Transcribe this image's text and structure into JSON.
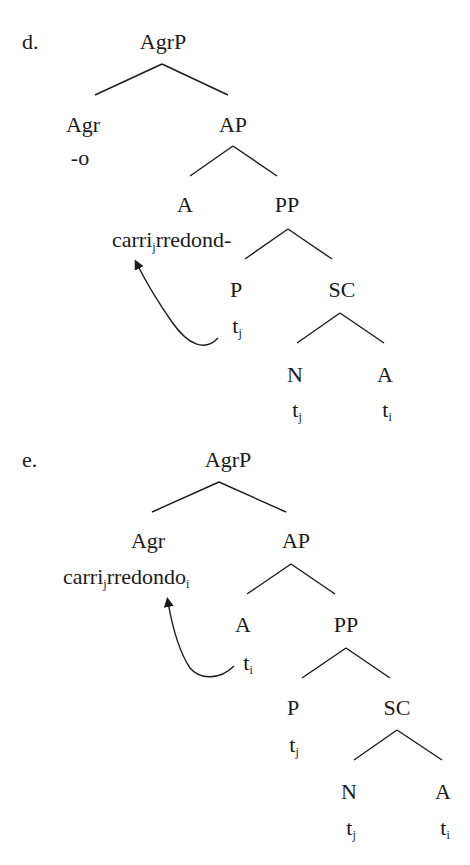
{
  "diagram": {
    "type": "syntax-tree",
    "trees": [
      {
        "label": "d.",
        "root": "AgrP",
        "nodes": {
          "agrp": "AgrP",
          "agr": "Agr",
          "agr_content": "-o",
          "ap": "AP",
          "a": "A",
          "a_content_base": "carri",
          "a_content_sub": "j",
          "a_content_rest": "rredond-",
          "pp": "PP",
          "p": "P",
          "p_trace": "t",
          "p_trace_sub": "j",
          "sc": "SC",
          "n": "N",
          "n_trace": "t",
          "n_trace_sub": "j",
          "sc_a": "A",
          "sc_a_trace": "t",
          "sc_a_trace_sub": "i"
        },
        "movement": {
          "from": "P trace t_j",
          "to": "carri_j"
        }
      },
      {
        "label": "e.",
        "root": "AgrP",
        "nodes": {
          "agrp": "AgrP",
          "agr": "Agr",
          "agr_content_base": "carri",
          "agr_content_sub": "j",
          "agr_content_rest": "rredondo",
          "agr_content_sub2": "i",
          "ap": "AP",
          "a": "A",
          "a_trace": "t",
          "a_trace_sub": "i",
          "pp": "PP",
          "p": "P",
          "p_trace": "t",
          "p_trace_sub": "j",
          "sc": "SC",
          "n": "N",
          "n_trace": "t",
          "n_trace_sub": "j",
          "sc_a": "A",
          "sc_a_trace": "t",
          "sc_a_trace_sub": "i"
        },
        "movement": {
          "from": "A trace t_i",
          "to": "carrijrredondo_i"
        }
      }
    ]
  }
}
